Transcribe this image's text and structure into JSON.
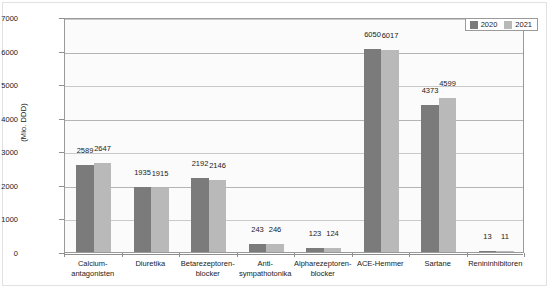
{
  "chart_data": {
    "type": "bar",
    "title": "",
    "subtitle": "",
    "xlabel": "",
    "ylabel": "(Mio. DDD)",
    "ylim": [
      0,
      7000
    ],
    "ytick_values": [
      0,
      1000,
      2000,
      3000,
      4000,
      5000,
      6000,
      7000
    ],
    "ytick_labels": [
      "0",
      "1000",
      "2000",
      "3000",
      "4000",
      "5000",
      "6000",
      "7000"
    ],
    "grid": true,
    "legend_position": "top-right",
    "categories": [
      "Calcium-\nantagonisten",
      "Diuretika",
      "Betarezeptoren-\nblocker",
      "Anti-\nsympathotonika",
      "Alpharezeptoren-\nblocker",
      "ACE-Hemmer",
      "Sartane",
      "Renininhibitoren"
    ],
    "series": [
      {
        "name": "2020",
        "color": "#7b7b7b",
        "values": [
          2589,
          1935,
          2192,
          243,
          123,
          6050,
          4373,
          13
        ]
      },
      {
        "name": "2021",
        "color": "#b9b9b9",
        "values": [
          2647,
          1915,
          2146,
          246,
          124,
          6017,
          4599,
          11
        ]
      }
    ],
    "data_labels": [
      [
        "2589",
        "2647"
      ],
      [
        "1935",
        "1915"
      ],
      [
        "2192",
        "2146"
      ],
      [
        "243",
        "246"
      ],
      [
        "123",
        "124"
      ],
      [
        "6050",
        "6017"
      ],
      [
        "4373",
        "4599"
      ],
      [
        "13",
        "11"
      ]
    ]
  },
  "legend": {
    "items": [
      {
        "label": "2020",
        "color": "#7b7b7b"
      },
      {
        "label": "2021",
        "color": "#b9b9b9"
      }
    ]
  },
  "colors": {
    "series_2020": "#7b7b7b",
    "series_2021": "#b9b9b9",
    "grid": "#c9c9c9",
    "axis": "#8f8f8f",
    "plot_background": "#fbfbfb",
    "figure_background": "#ffffff",
    "text": "#1a1a1a"
  }
}
